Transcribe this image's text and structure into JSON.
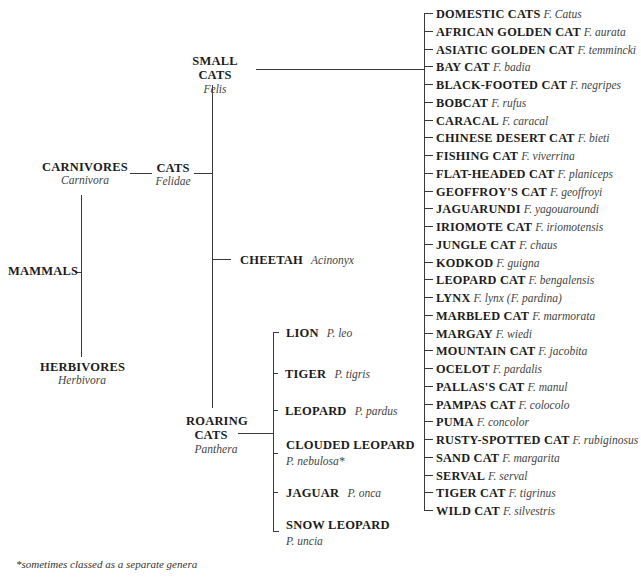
{
  "diagram": {
    "root": {
      "common": "MAMMALS"
    },
    "carnivores": {
      "common": "CARNIVORES",
      "scientific": "Carnivora"
    },
    "herbivores": {
      "common": "HERBIVORES",
      "scientific": "Herbivora"
    },
    "cats": {
      "common": "CATS",
      "scientific": "Felidae"
    },
    "small_cats": {
      "common": "SMALL CATS",
      "scientific": "Felis"
    },
    "cheetah": {
      "common": "CHEETAH",
      "scientific": "Acinonyx"
    },
    "roaring_cats": {
      "common_line1": "ROARING",
      "common_line2": "CATS",
      "scientific": "Panthera"
    },
    "roaring_species": [
      {
        "common": "LION",
        "scientific": "P. leo"
      },
      {
        "common": "TIGER",
        "scientific": "P. tigris"
      },
      {
        "common": "LEOPARD",
        "scientific": "P. pardus"
      },
      {
        "common": "CLOUDED LEOPARD",
        "scientific": "P. nebulosa*"
      },
      {
        "common": "JAGUAR",
        "scientific": "P. onca"
      },
      {
        "common": "SNOW LEOPARD",
        "scientific": "P. uncia"
      }
    ],
    "small_species": [
      {
        "common": "DOMESTIC CATS",
        "scientific": "F. Catus"
      },
      {
        "common": "AFRICAN GOLDEN CAT",
        "scientific": "F. aurata"
      },
      {
        "common": "ASIATIC GOLDEN CAT",
        "scientific": "F. temmincki"
      },
      {
        "common": "BAY CAT",
        "scientific": "F. badia"
      },
      {
        "common": "BLACK-FOOTED CAT",
        "scientific": "F. negripes"
      },
      {
        "common": "BOBCAT",
        "scientific": "F. rufus"
      },
      {
        "common": "CARACAL",
        "scientific": "F. caracal"
      },
      {
        "common": "CHINESE DESERT CAT",
        "scientific": "F. bieti"
      },
      {
        "common": "FISHING CAT",
        "scientific": "F. viverrina"
      },
      {
        "common": "FLAT-HEADED CAT",
        "scientific": "F. planiceps"
      },
      {
        "common": "GEOFFROY'S CAT",
        "scientific": "F. geoffroyi"
      },
      {
        "common": "JAGUARUNDI",
        "scientific": "F. yagouaroundi"
      },
      {
        "common": "IRIOMOTE CAT",
        "scientific": "F. iriomotensis"
      },
      {
        "common": "JUNGLE CAT",
        "scientific": "F. chaus"
      },
      {
        "common": "KODKOD",
        "scientific": "F. guigna"
      },
      {
        "common": "LEOPARD CAT",
        "scientific": "F. bengalensis"
      },
      {
        "common": "LYNX",
        "scientific": "F. lynx (F. pardina)"
      },
      {
        "common": "MARBLED CAT",
        "scientific": "F. marmorata"
      },
      {
        "common": "MARGAY",
        "scientific": "F. wiedi"
      },
      {
        "common": "MOUNTAIN CAT",
        "scientific": "F. jacobita"
      },
      {
        "common": "OCELOT",
        "scientific": "F. pardalis"
      },
      {
        "common": "PALLAS'S CAT",
        "scientific": "F. manul"
      },
      {
        "common": "PAMPAS CAT",
        "scientific": "F. colocolo"
      },
      {
        "common": "PUMA",
        "scientific": "F. concolor"
      },
      {
        "common": "RUSTY-SPOTTED CAT",
        "scientific": "F. rubiginosus"
      },
      {
        "common": "SAND CAT",
        "scientific": "F. margarita"
      },
      {
        "common": "SERVAL",
        "scientific": "F. serval"
      },
      {
        "common": "TIGER CAT",
        "scientific": "F. tigrinus"
      },
      {
        "common": "WILD CAT",
        "scientific": "F. silvestris"
      }
    ],
    "footnote": "*sometimes classed as a separate genera",
    "colors": {
      "line": "#3a3a3a",
      "text": "#1c1c1c",
      "scientific": "#444444"
    }
  }
}
